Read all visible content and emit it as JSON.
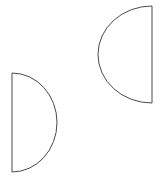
{
  "canvas": {
    "width": 163,
    "height": 186,
    "background_color": "#ffffff"
  },
  "style": {
    "stroke_color": "#4a4a4a",
    "stroke_width": 1,
    "fill_color": "none"
  },
  "shapes": [
    {
      "id": "left-half-disc",
      "name": "half-disc-shape-left",
      "description": "D shape: vertical straight edge on the left, semicircular arc bulging to the right",
      "flat_edge_side": "left",
      "flat_edge_x": 12,
      "top_y": 73,
      "bottom_y": 172,
      "arc_extreme_x": 57,
      "width": 45,
      "height": 99,
      "path": "M 12 73 A 45 49.5 0 0 1 12 172 Z"
    },
    {
      "id": "right-half-disc",
      "name": "half-disc-shape-right",
      "description": "Mirrored D shape: vertical straight edge on the right, semicircular arc bulging to the left",
      "flat_edge_side": "right",
      "flat_edge_x": 152,
      "top_y": 6,
      "bottom_y": 103,
      "arc_extreme_x": 98,
      "width": 54,
      "height": 97,
      "path": "M 152 6 A 54 48.5 0 0 0 152 103 Z"
    }
  ]
}
